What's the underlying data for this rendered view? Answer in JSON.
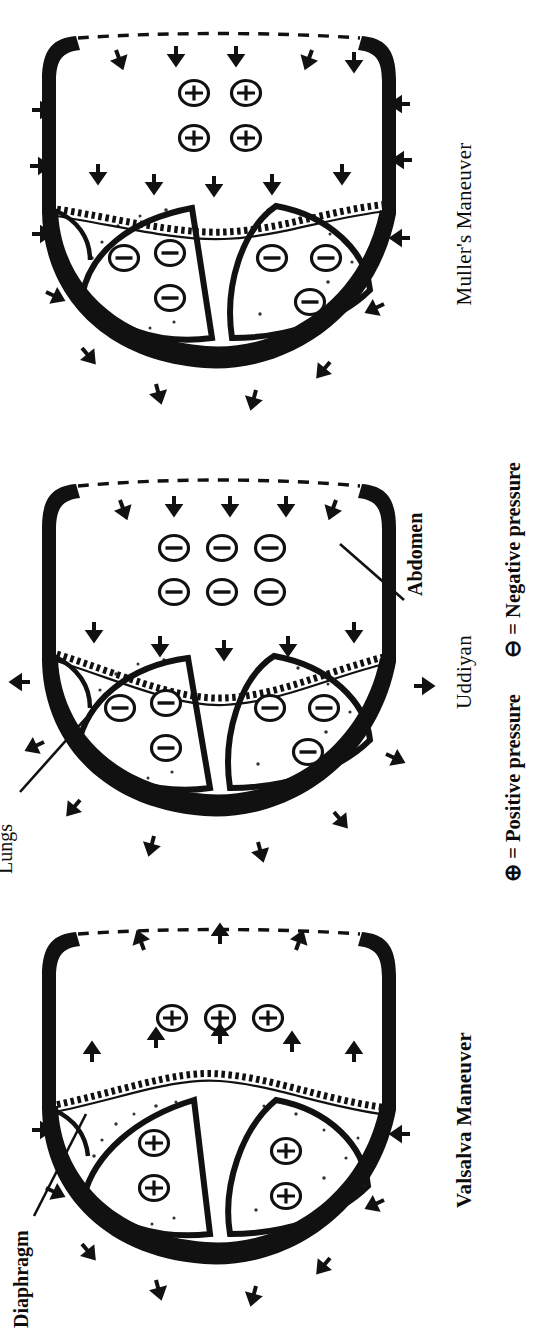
{
  "figure": {
    "orientation": "rotated-90-ccw",
    "kind": "medical-line-drawing",
    "panel_count": 3
  },
  "panels": [
    {
      "id": "valsalva",
      "title": "Valsalva Maneuver",
      "title_style": "bold",
      "lungs": {
        "upper_lobe_symbols": [
          "positive",
          "positive"
        ],
        "lower_lobe_symbols": [
          "positive",
          "positive"
        ],
        "symbol_glyph": "⊕"
      },
      "abdomen": {
        "symbols": [
          "positive",
          "positive",
          "positive"
        ],
        "symbol_glyph": "⊕",
        "arrangement": "vertical-3"
      },
      "arrows": {
        "chest_wall": "inward",
        "diaphragm": "outward-toward-abdomen",
        "abdominal_wall": "outward"
      }
    },
    {
      "id": "uddiyan",
      "title": "Uddiyan",
      "title_style": "normal",
      "lungs": {
        "upper_lobe_symbols": [
          "negative",
          "negative",
          "negative"
        ],
        "lower_lobe_symbols": [
          "negative",
          "negative",
          "negative"
        ],
        "symbol_glyph": "⊖"
      },
      "abdomen": {
        "symbols": [
          "negative",
          "negative",
          "negative",
          "negative",
          "negative",
          "negative"
        ],
        "symbol_glyph": "⊖",
        "arrangement": "grid-3x2"
      },
      "arrows": {
        "chest_wall": "outward",
        "diaphragm": "inward-toward-chest",
        "abdominal_wall": "inward"
      }
    },
    {
      "id": "muller",
      "title": "Muller's Maneuver",
      "title_style": "normal",
      "lungs": {
        "upper_lobe_symbols": [
          "negative",
          "negative",
          "negative"
        ],
        "lower_lobe_symbols": [
          "negative",
          "negative",
          "negative"
        ],
        "symbol_glyph": "⊖"
      },
      "abdomen": {
        "symbols": [
          "positive",
          "positive",
          "positive",
          "positive"
        ],
        "symbol_glyph": "⊕",
        "arrangement": "grid-2x2"
      },
      "arrows": {
        "chest_wall": "inward",
        "diaphragm": "inward-toward-chest",
        "abdominal_wall": "inward"
      }
    }
  ],
  "annotations": {
    "diaphragm_label": "Diaphragm",
    "lungs_label": "Lungs",
    "abdomen_label": "Abdomen"
  },
  "legend": {
    "positive_symbol": "⊕",
    "positive_text": "= Positive pressure",
    "negative_symbol": "⊖",
    "negative_text": "= Negative pressure"
  },
  "colors": {
    "ink": "#111111",
    "paper": "#ffffff"
  }
}
